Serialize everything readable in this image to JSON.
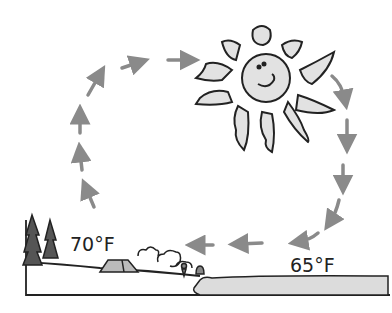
{
  "diagram": {
    "land_temperature": "70°F",
    "sea_temperature": "65°F",
    "elements": [
      "sun-icon",
      "tree-icon",
      "tent-icon",
      "bushes-icon",
      "person-icon",
      "water",
      "circulation-arrows"
    ],
    "colors": {
      "arrow": "#8a8a8a",
      "fill": "#e2e2e2",
      "outline": "#222222"
    }
  }
}
